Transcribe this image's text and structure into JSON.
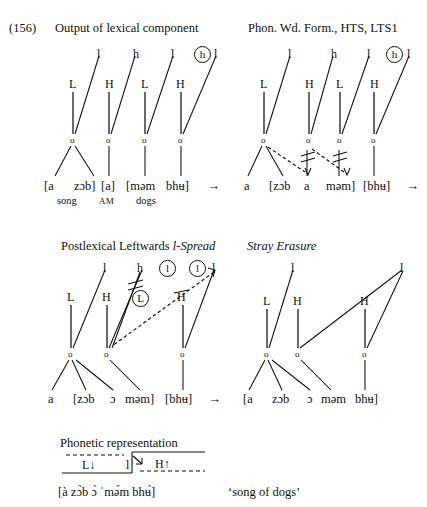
{
  "example": {
    "number": "(156)"
  },
  "panels": [
    {
      "id": "lexical-output",
      "title": "Output of lexical component",
      "title_italic": false,
      "tones_upper": [
        "l",
        "h",
        "l",
        "h",
        "l"
      ],
      "tones_upper_circled": [
        false,
        false,
        false,
        true,
        false
      ],
      "tones_lower": [
        "L",
        "H",
        "L",
        "H"
      ],
      "segments": [
        "[a",
        "zɔb]",
        "[a]",
        "[məm",
        "bhʉ]"
      ],
      "glosses": [
        "song",
        "AM",
        "dogs"
      ],
      "arrow": "→"
    },
    {
      "id": "phon-wd-form",
      "title": "Phon. Wd. Form., HTS, LTS1",
      "title_italic": false,
      "tones_upper": [
        "l",
        "h",
        "l",
        "h",
        "l"
      ],
      "tones_upper_circled": [
        false,
        false,
        false,
        true,
        false
      ],
      "tones_lower": [
        "L",
        "H",
        "L",
        "H"
      ],
      "segments": [
        "a",
        "[zɔb",
        "a",
        "məm]",
        "[bhʉ]"
      ],
      "arrow": "→"
    },
    {
      "id": "postlexical-l-spread",
      "title": "Postlexical Leftwards l-Spread",
      "title_italic_part": "l-Spread",
      "title_plain_part": "Postlexical Leftwards ",
      "tones_upper": [
        "l",
        "h",
        "l",
        "l",
        "l"
      ],
      "tones_upper_circled": [
        false,
        false,
        true,
        true,
        false
      ],
      "tones_lower": [
        "L",
        "H",
        "L",
        "H"
      ],
      "tones_lower_circled": [
        false,
        false,
        true,
        false
      ],
      "segments": [
        "a",
        "[zɔb",
        "ɔ",
        "məm]",
        "[bhʉ]"
      ],
      "arrow": "→"
    },
    {
      "id": "stray-erasure",
      "title": "Stray Erasure",
      "title_italic": true,
      "tones_upper": [
        "l",
        "l"
      ],
      "tones_lower": [
        "L",
        "H",
        "H"
      ],
      "segments": [
        "[a",
        "zɔb",
        "ɔ",
        "məm",
        "bhʉ]"
      ]
    }
  ],
  "phonetic": {
    "heading": "Phonetic representation",
    "low_label": "L↓",
    "mid_label": "l",
    "high_label": "H↑",
    "ipa": "[à zɔ̀b ɔ̀  ˈmə́m bhʉ́]",
    "translation": "‘song of dogs’"
  },
  "mora_symbol": "o"
}
